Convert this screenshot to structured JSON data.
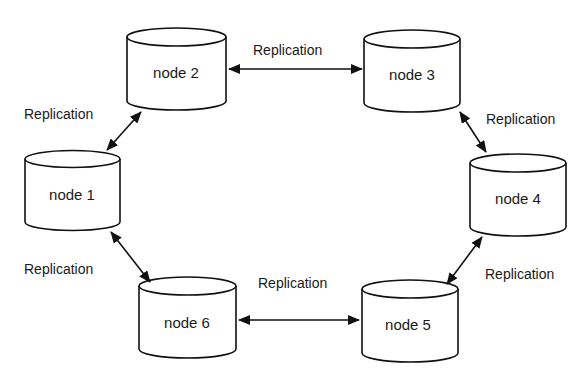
{
  "diagram": {
    "type": "ring-replication",
    "nodes": [
      {
        "id": "n1",
        "label": "node 1",
        "x": 25,
        "y": 150,
        "w": 95,
        "h": 80
      },
      {
        "id": "n2",
        "label": "node 2",
        "x": 127,
        "y": 28,
        "w": 99,
        "h": 82
      },
      {
        "id": "n3",
        "label": "node 3",
        "x": 364,
        "y": 30,
        "w": 96,
        "h": 82
      },
      {
        "id": "n4",
        "label": "node 4",
        "x": 470,
        "y": 154,
        "w": 96,
        "h": 82
      },
      {
        "id": "n5",
        "label": "node 5",
        "x": 362,
        "y": 280,
        "w": 96,
        "h": 82
      },
      {
        "id": "n6",
        "label": "node 6",
        "x": 139,
        "y": 277,
        "w": 97,
        "h": 81
      }
    ],
    "edges": [
      {
        "from": "node 2",
        "to": "node 3",
        "label": "Replication",
        "bidirectional": true
      },
      {
        "from": "node 3",
        "to": "node 4",
        "label": "Replication",
        "bidirectional": true
      },
      {
        "from": "node 4",
        "to": "node 5",
        "label": "Replication",
        "bidirectional": true
      },
      {
        "from": "node 5",
        "to": "node 6",
        "label": "Replication",
        "bidirectional": true
      },
      {
        "from": "node 6",
        "to": "node 1",
        "label": "Replication",
        "bidirectional": true
      },
      {
        "from": "node 1",
        "to": "node 2",
        "label": "Replication",
        "bidirectional": true
      }
    ]
  },
  "labels": {
    "node1": "node 1",
    "node2": "node 2",
    "node3": "node 3",
    "node4": "node 4",
    "node5": "node 5",
    "node6": "node 6",
    "edge_2_3": "Replication",
    "edge_3_4": "Replication",
    "edge_4_5": "Replication",
    "edge_5_6": "Replication",
    "edge_6_1": "Replication",
    "edge_1_2": "Replication"
  },
  "colors": {
    "stroke": "#111111",
    "background": "#ffffff",
    "text": "#1a1a1a"
  }
}
